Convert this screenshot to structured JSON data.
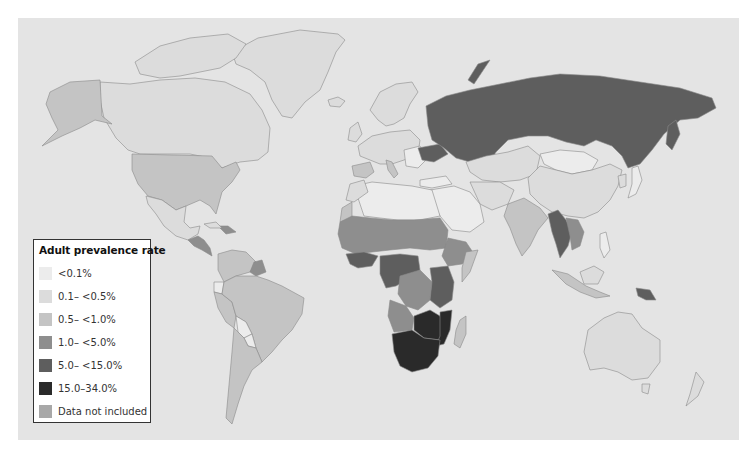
{
  "legend": {
    "title": "Adult prevalence rate",
    "items": [
      {
        "label": "<0.1%",
        "color": "#ececec"
      },
      {
        "label": "0.1– <0.5%",
        "color": "#dcdcdc"
      },
      {
        "label": "0.5– <1.0%",
        "color": "#c4c4c4"
      },
      {
        "label": "1.0– <5.0%",
        "color": "#8e8e8e"
      },
      {
        "label": "5.0– <15.0%",
        "color": "#5e5e5e"
      },
      {
        "label": "15.0–34.0%",
        "color": "#2a2a2a"
      },
      {
        "label": "Data not included",
        "color": "#a8a8a8"
      }
    ]
  },
  "map": {
    "ocean_color": "#e4e4e4",
    "border_color": "#8a8a8a"
  }
}
